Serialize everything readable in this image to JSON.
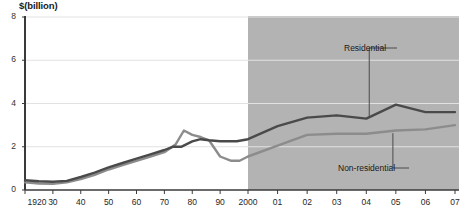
{
  "chart_data": {
    "type": "line",
    "title": "$(billion)",
    "ylabel": "$(billion)",
    "xlabel": "",
    "ylim": [
      0,
      8
    ],
    "yticks": [
      0,
      2,
      4,
      6,
      8
    ],
    "ytick_labels": [
      "0",
      "2",
      "4",
      "6",
      "8"
    ],
    "grid": true,
    "grid_axis": "y",
    "legend_position": "inline-annotations",
    "xtick_labels": [
      "1920",
      "30",
      "40",
      "50",
      "60",
      "70",
      "80",
      "90",
      "2000",
      "01",
      "02",
      "03",
      "04",
      "05",
      "06",
      "07"
    ],
    "xtick_values": [
      1920,
      1930,
      1940,
      1950,
      1960,
      1970,
      1980,
      1990,
      2000,
      2001,
      2002,
      2003,
      2004,
      2005,
      2006,
      2007
    ],
    "xlim": [
      1920,
      2007
    ],
    "shaded_region": {
      "label": "2000-2007",
      "x_start": 2000,
      "x_end": 2007,
      "color": "#b3b3b3"
    },
    "series": [
      {
        "name": "Residential",
        "color": "#4a4a4a",
        "x": [
          1920,
          1930,
          1940,
          1950,
          1960,
          1970,
          1975,
          1980,
          1985,
          1990,
          1995,
          2000,
          2001,
          2002,
          2003,
          2004,
          2005,
          2006,
          2007
        ],
        "values": [
          0.5,
          0.4,
          0.6,
          1.0,
          1.5,
          1.9,
          2.1,
          2.4,
          2.5,
          2.4,
          2.3,
          2.4,
          3.0,
          3.4,
          3.5,
          3.3,
          3.9,
          3.6,
          3.6
        ]
      },
      {
        "name": "Non-residential",
        "color": "#8c8c8c",
        "x": [
          1920,
          1930,
          1940,
          1950,
          1960,
          1970,
          1975,
          1980,
          1985,
          1990,
          1995,
          2000,
          2001,
          2002,
          2003,
          2004,
          2005,
          2006,
          2007
        ],
        "values": [
          0.4,
          0.3,
          0.5,
          0.9,
          1.4,
          1.8,
          2.1,
          2.8,
          2.3,
          1.8,
          1.3,
          1.5,
          2.2,
          2.8,
          2.7,
          2.6,
          2.7,
          2.8,
          3.0
        ]
      }
    ],
    "residential_points": [
      [
        1920,
        0.45
      ],
      [
        1925,
        0.4
      ],
      [
        1930,
        0.38
      ],
      [
        1935,
        0.42
      ],
      [
        1940,
        0.6
      ],
      [
        1945,
        0.8
      ],
      [
        1950,
        1.05
      ],
      [
        1955,
        1.25
      ],
      [
        1960,
        1.45
      ],
      [
        1965,
        1.65
      ],
      [
        1970,
        1.85
      ],
      [
        1973,
        2.0
      ],
      [
        1976,
        2.0
      ],
      [
        1980,
        2.25
      ],
      [
        1983,
        2.35
      ],
      [
        1986,
        2.3
      ],
      [
        1990,
        2.25
      ],
      [
        1993,
        2.25
      ],
      [
        1996,
        2.25
      ],
      [
        2000,
        2.35
      ],
      [
        2001,
        2.95
      ],
      [
        2002,
        3.35
      ],
      [
        2003,
        3.45
      ],
      [
        2004,
        3.3
      ],
      [
        2005,
        3.95
      ],
      [
        2006,
        3.6
      ],
      [
        2007,
        3.6
      ]
    ],
    "nonresidential_points": [
      [
        1920,
        0.35
      ],
      [
        1925,
        0.3
      ],
      [
        1930,
        0.28
      ],
      [
        1935,
        0.35
      ],
      [
        1940,
        0.5
      ],
      [
        1945,
        0.7
      ],
      [
        1950,
        0.95
      ],
      [
        1955,
        1.15
      ],
      [
        1960,
        1.35
      ],
      [
        1965,
        1.55
      ],
      [
        1970,
        1.75
      ],
      [
        1974,
        2.1
      ],
      [
        1977,
        2.75
      ],
      [
        1980,
        2.55
      ],
      [
        1983,
        2.45
      ],
      [
        1986,
        2.3
      ],
      [
        1990,
        1.55
      ],
      [
        1994,
        1.35
      ],
      [
        1997,
        1.35
      ],
      [
        2000,
        1.55
      ],
      [
        2001,
        2.05
      ],
      [
        2002,
        2.55
      ],
      [
        2003,
        2.6
      ],
      [
        2004,
        2.6
      ],
      [
        2005,
        2.75
      ],
      [
        2006,
        2.8
      ],
      [
        2007,
        3.0
      ]
    ],
    "annotations": [
      {
        "text": "Residential",
        "x_label": 344,
        "y_label": 43
      },
      {
        "text": "Non-residential",
        "x_label": 338,
        "y_label": 163
      }
    ]
  }
}
